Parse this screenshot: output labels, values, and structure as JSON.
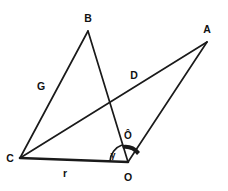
{
  "diagram": {
    "background_color": "#ffffff",
    "stroke_color": "#1a1a1a",
    "vertices": [
      {
        "id": "B",
        "label": "B",
        "x": 88,
        "y": 31,
        "label_x": 88,
        "label_y": 22
      },
      {
        "id": "A",
        "label": "A",
        "x": 207,
        "y": 42,
        "label_x": 207,
        "label_y": 33
      },
      {
        "id": "C",
        "label": "C",
        "x": 20,
        "y": 158,
        "label_x": 10,
        "label_y": 162
      },
      {
        "id": "O",
        "label": "O",
        "x": 128,
        "y": 162,
        "label_x": 128,
        "label_y": 180
      }
    ],
    "edges": [
      {
        "id": "CB",
        "from": "C",
        "to": "B",
        "label": "G",
        "label_x": 41,
        "label_y": 90,
        "weight": "thin"
      },
      {
        "id": "BO",
        "from": "B",
        "to": "O",
        "label": "",
        "label_x": 0,
        "label_y": 0,
        "weight": "thin"
      },
      {
        "id": "CA",
        "from": "C",
        "to": "A",
        "label": "D",
        "label_x": 134,
        "label_y": 79,
        "weight": "thin"
      },
      {
        "id": "OA",
        "from": "O",
        "to": "A",
        "label": "",
        "label_x": 0,
        "label_y": 0,
        "weight": "thin"
      },
      {
        "id": "CO",
        "from": "C",
        "to": "O",
        "label": "r",
        "label_x": 65,
        "label_y": 176,
        "weight": "thick"
      }
    ],
    "angles": [
      {
        "id": "O-hat",
        "label": "Ô",
        "label_x": 128,
        "label_y": 137,
        "at_vertex": "O",
        "between": [
          "B",
          "A"
        ]
      },
      {
        "id": "gamma",
        "label": "γ",
        "label_x": 113,
        "label_y": 157,
        "at_vertex": "O",
        "between": [
          "C",
          "B"
        ]
      }
    ]
  }
}
